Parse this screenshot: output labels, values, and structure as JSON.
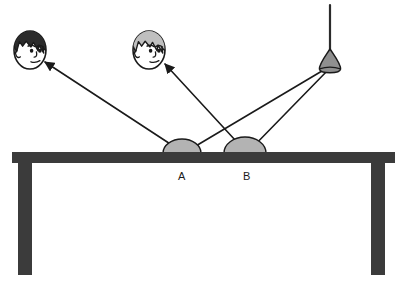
{
  "diagram": {
    "type": "physics-ray-diagram",
    "background_color": "#ffffff",
    "ink_color": "#1a1a1a",
    "table": {
      "name": "table",
      "color": "#3b3b3b",
      "top": {
        "x": 12,
        "y": 152,
        "width": 383,
        "height": 11
      },
      "legs": [
        {
          "x": 18,
          "y": 163,
          "width": 14,
          "height": 112
        },
        {
          "x": 371,
          "y": 163,
          "width": 14,
          "height": 112
        }
      ]
    },
    "lamp": {
      "name": "pendant-lamp",
      "cord": {
        "x1": 330,
        "y1": 5,
        "x2": 330,
        "y2": 51
      },
      "cord_color": "#2b2b2b",
      "bulb": {
        "cx": 330,
        "cy": 62,
        "rx": 11,
        "ry": 13
      },
      "bulb_fill": "#8f8f8f",
      "bulb_stroke": "#1a1a1a",
      "emission_point": {
        "x": 327,
        "y": 68
      }
    },
    "mirrors": [
      {
        "id": "A",
        "label": "A",
        "name": "mirror-a",
        "cx": 182,
        "base_y": 153,
        "rx": 19,
        "ry": 14,
        "fill": "#b3b3b3",
        "stroke": "#1a1a1a",
        "label_x": 182,
        "label_y": 180
      },
      {
        "id": "B",
        "label": "B",
        "name": "mirror-b",
        "cx": 245,
        "base_y": 153,
        "rx": 21,
        "ry": 16,
        "fill": "#b3b3b3",
        "stroke": "#1a1a1a",
        "label_x": 247,
        "label_y": 180
      }
    ],
    "heads": [
      {
        "id": "head-left",
        "name": "observer-head-dark",
        "hair_color": "#2b2b2b",
        "face_color": "#ffffff",
        "outline": "#1a1a1a",
        "cx": 30,
        "cy": 50,
        "rx": 16,
        "ry": 19
      },
      {
        "id": "head-right",
        "name": "observer-head-light",
        "hair_color": "#bfbfbf",
        "face_color": "#ffffff",
        "outline": "#1a1a1a",
        "cx": 149,
        "cy": 50,
        "rx": 16,
        "ry": 19
      }
    ],
    "rays": [
      {
        "id": "incident-a",
        "name": "incident-ray-lamp-to-a",
        "from": {
          "x": 327,
          "y": 68
        },
        "to": {
          "x": 184,
          "y": 153
        },
        "arrow": false,
        "stroke": "#1a1a1a",
        "width": 1.6
      },
      {
        "id": "incident-b",
        "name": "incident-ray-lamp-to-b",
        "from": {
          "x": 329,
          "y": 69
        },
        "to": {
          "x": 247,
          "y": 153
        },
        "arrow": false,
        "stroke": "#1a1a1a",
        "width": 1.6
      },
      {
        "id": "reflected-a",
        "name": "reflected-ray-a-to-dark-head",
        "from": {
          "x": 184,
          "y": 153
        },
        "to": {
          "x": 45,
          "y": 62
        },
        "arrow": true,
        "stroke": "#1a1a1a",
        "width": 1.6
      },
      {
        "id": "reflected-b",
        "name": "reflected-ray-b-to-light-head",
        "from": {
          "x": 247,
          "y": 153
        },
        "to": {
          "x": 165,
          "y": 64
        },
        "arrow": true,
        "stroke": "#1a1a1a",
        "width": 1.6
      }
    ],
    "labels": [
      {
        "text": "A",
        "x": 182,
        "y": 181
      },
      {
        "text": "B",
        "x": 247,
        "y": 181
      }
    ]
  }
}
